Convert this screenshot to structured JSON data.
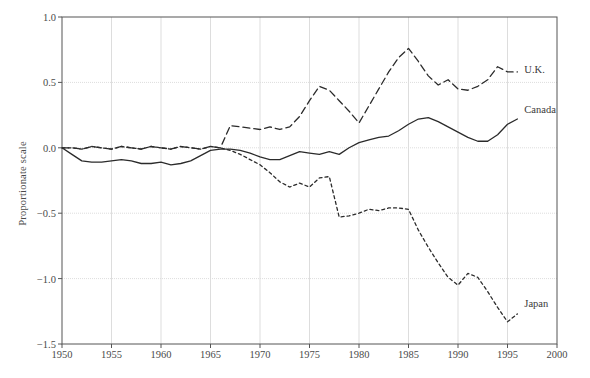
{
  "chart_data": {
    "type": "line",
    "title": "",
    "xlabel": "",
    "ylabel": "Proportionate scale",
    "xlim": [
      1950,
      2000
    ],
    "ylim": [
      -1.5,
      1.0
    ],
    "xticks": [
      1950,
      1955,
      1960,
      1965,
      1970,
      1975,
      1980,
      1985,
      1990,
      1995,
      2000
    ],
    "yticks": [
      -1.5,
      -1.0,
      -0.5,
      0.0,
      0.5,
      1.0
    ],
    "ytick_labels": [
      "−1.5",
      "−1.0",
      "−0.5",
      "0.0",
      "0.5",
      "1.0"
    ],
    "grid": true,
    "legend_position": "right-inline",
    "series": [
      {
        "name": "U.K.",
        "label": "U.K.",
        "style": "dashed",
        "color": "#2b2b2b",
        "x": [
          1950,
          1951,
          1952,
          1953,
          1954,
          1955,
          1956,
          1957,
          1958,
          1959,
          1960,
          1961,
          1962,
          1963,
          1964,
          1965,
          1966,
          1967,
          1968,
          1969,
          1970,
          1971,
          1972,
          1973,
          1974,
          1975,
          1976,
          1977,
          1978,
          1979,
          1980,
          1981,
          1982,
          1983,
          1984,
          1985,
          1986,
          1987,
          1988,
          1989,
          1990,
          1991,
          1992,
          1993,
          1994,
          1995,
          1996
        ],
        "y": [
          0.0,
          0.0,
          -0.01,
          0.01,
          0.0,
          -0.01,
          0.01,
          0.0,
          -0.01,
          0.01,
          0.0,
          -0.01,
          0.01,
          0.0,
          -0.01,
          0.01,
          0.0,
          0.17,
          0.16,
          0.15,
          0.14,
          0.16,
          0.14,
          0.16,
          0.24,
          0.36,
          0.47,
          0.44,
          0.36,
          0.28,
          0.19,
          0.32,
          0.45,
          0.58,
          0.69,
          0.76,
          0.66,
          0.55,
          0.48,
          0.52,
          0.45,
          0.44,
          0.47,
          0.52,
          0.62,
          0.58,
          0.58
        ]
      },
      {
        "name": "Canada",
        "label": "Canada",
        "style": "solid",
        "color": "#2b2b2b",
        "x": [
          1950,
          1951,
          1952,
          1953,
          1954,
          1955,
          1956,
          1957,
          1958,
          1959,
          1960,
          1961,
          1962,
          1963,
          1964,
          1965,
          1966,
          1967,
          1968,
          1969,
          1970,
          1971,
          1972,
          1973,
          1974,
          1975,
          1976,
          1977,
          1978,
          1979,
          1980,
          1981,
          1982,
          1983,
          1984,
          1985,
          1986,
          1987,
          1988,
          1989,
          1990,
          1991,
          1992,
          1993,
          1994,
          1995,
          1996
        ],
        "y": [
          0.0,
          -0.05,
          -0.1,
          -0.11,
          -0.11,
          -0.1,
          -0.09,
          -0.1,
          -0.12,
          -0.12,
          -0.11,
          -0.13,
          -0.12,
          -0.1,
          -0.06,
          -0.02,
          -0.01,
          -0.01,
          -0.02,
          -0.04,
          -0.07,
          -0.09,
          -0.09,
          -0.06,
          -0.03,
          -0.04,
          -0.05,
          -0.03,
          -0.05,
          0.0,
          0.04,
          0.06,
          0.08,
          0.09,
          0.13,
          0.18,
          0.22,
          0.23,
          0.2,
          0.16,
          0.12,
          0.08,
          0.05,
          0.05,
          0.1,
          0.18,
          0.22
        ]
      },
      {
        "name": "Japan",
        "label": "Japan",
        "style": "dotted",
        "color": "#2b2b2b",
        "x": [
          1950,
          1951,
          1952,
          1953,
          1954,
          1955,
          1956,
          1957,
          1958,
          1959,
          1960,
          1961,
          1962,
          1963,
          1964,
          1965,
          1966,
          1967,
          1968,
          1969,
          1970,
          1971,
          1972,
          1973,
          1974,
          1975,
          1976,
          1977,
          1978,
          1979,
          1980,
          1981,
          1982,
          1983,
          1984,
          1985,
          1986,
          1987,
          1988,
          1989,
          1990,
          1991,
          1992,
          1993,
          1994,
          1995,
          1996
        ],
        "y": [
          0.0,
          0.0,
          -0.01,
          0.01,
          0.0,
          -0.01,
          0.01,
          0.0,
          -0.01,
          0.01,
          0.0,
          -0.01,
          0.01,
          0.0,
          -0.01,
          0.01,
          0.0,
          -0.02,
          -0.05,
          -0.09,
          -0.13,
          -0.19,
          -0.26,
          -0.3,
          -0.27,
          -0.3,
          -0.23,
          -0.22,
          -0.53,
          -0.52,
          -0.5,
          -0.47,
          -0.48,
          -0.46,
          -0.46,
          -0.47,
          -0.63,
          -0.76,
          -0.88,
          -0.99,
          -1.05,
          -0.96,
          -0.99,
          -1.1,
          -1.22,
          -1.33,
          -1.27
        ]
      }
    ],
    "annotations": [
      {
        "text": "U.K.",
        "x": 1996.5,
        "y": 0.585
      },
      {
        "text": "Canada",
        "x": 1996.5,
        "y": 0.28
      },
      {
        "text": "Japan",
        "x": 1996.5,
        "y": -1.2
      }
    ]
  },
  "colors": {
    "axis": "#555555",
    "grid": "#dddddd",
    "line": "#2b2b2b",
    "text": "#4a4a4a"
  }
}
